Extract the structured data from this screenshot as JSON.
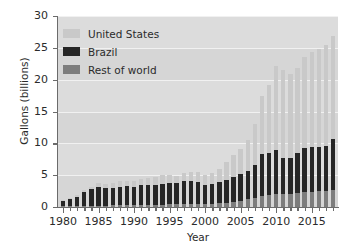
{
  "chart_data": {
    "type": "bar",
    "title": "",
    "xlabel": "Year",
    "ylabel": "Gallons (billions)",
    "stacked": true,
    "grid": true,
    "legend_position": "upper-left",
    "xlim": [
      1979.3,
      2018.7
    ],
    "ylim": [
      0,
      30
    ],
    "yticks": [
      0,
      5,
      10,
      15,
      20,
      25,
      30
    ],
    "ytick_labels": [
      "0",
      "5",
      "10",
      "15",
      "20",
      "25",
      "30"
    ],
    "xticks": [
      1980,
      1985,
      1990,
      1995,
      2000,
      2005,
      2010,
      2015
    ],
    "xtick_labels": [
      "1980",
      "1985",
      "1990",
      "1995",
      "2000",
      "2005",
      "2010",
      "2015"
    ],
    "categories": [
      1980,
      1981,
      1982,
      1983,
      1984,
      1985,
      1986,
      1987,
      1988,
      1989,
      1990,
      1991,
      1992,
      1993,
      1994,
      1995,
      1996,
      1997,
      1998,
      1999,
      2000,
      2001,
      2002,
      2003,
      2004,
      2005,
      2006,
      2007,
      2008,
      2009,
      2010,
      2011,
      2012,
      2013,
      2014,
      2015,
      2016,
      2017,
      2018
    ],
    "series": [
      {
        "name": "Rest of world",
        "color": "#7d7d7d",
        "values": [
          0.1,
          0.12,
          0.14,
          0.16,
          0.18,
          0.2,
          0.22,
          0.24,
          0.26,
          0.28,
          0.3,
          0.32,
          0.34,
          0.36,
          0.38,
          0.4,
          0.42,
          0.45,
          0.48,
          0.5,
          0.52,
          0.55,
          0.6,
          0.7,
          0.85,
          1.0,
          1.2,
          1.45,
          1.8,
          1.95,
          2.1,
          2.1,
          2.05,
          2.2,
          2.35,
          2.4,
          2.45,
          2.55,
          2.7
        ]
      },
      {
        "name": "Brazil",
        "color": "#262626",
        "values": [
          0.9,
          1.1,
          1.5,
          2.2,
          2.6,
          2.9,
          2.7,
          2.7,
          2.9,
          3.0,
          2.9,
          3.1,
          3.1,
          3.1,
          3.3,
          3.3,
          3.3,
          3.6,
          3.6,
          3.5,
          2.9,
          3.0,
          3.3,
          3.5,
          3.9,
          4.2,
          4.5,
          5.1,
          6.5,
          6.6,
          6.9,
          5.6,
          5.6,
          6.3,
          6.9,
          7.1,
          7.0,
          7.1,
          8.0
        ]
      },
      {
        "name": "United States",
        "color": "#c9c9c9",
        "values": [
          0.18,
          0.22,
          0.28,
          0.38,
          0.43,
          0.61,
          0.71,
          0.83,
          0.85,
          0.87,
          0.9,
          0.95,
          1.1,
          1.2,
          1.35,
          1.4,
          1.1,
          1.3,
          1.4,
          1.47,
          1.63,
          1.77,
          2.13,
          2.8,
          3.4,
          3.9,
          4.9,
          6.5,
          9.2,
          10.6,
          13.2,
          13.9,
          13.3,
          13.3,
          14.3,
          14.8,
          15.4,
          15.8,
          16.1
        ]
      }
    ],
    "totals": [
      1.18,
      1.44,
      1.92,
      2.74,
      3.21,
      3.71,
      3.63,
      3.77,
      4.01,
      4.15,
      4.1,
      4.37,
      4.54,
      4.66,
      5.03,
      5.1,
      4.82,
      5.35,
      5.48,
      5.47,
      5.05,
      5.32,
      6.03,
      7.0,
      8.15,
      9.1,
      10.6,
      13.05,
      17.5,
      19.15,
      22.2,
      21.6,
      20.95,
      21.8,
      23.55,
      24.3,
      24.85,
      25.45,
      26.8
    ]
  },
  "legend": {
    "items": [
      {
        "label": "United States",
        "color": "#c9c9c9"
      },
      {
        "label": "Brazil",
        "color": "#262626"
      },
      {
        "label": "Rest of world",
        "color": "#7d7d7d"
      }
    ]
  }
}
